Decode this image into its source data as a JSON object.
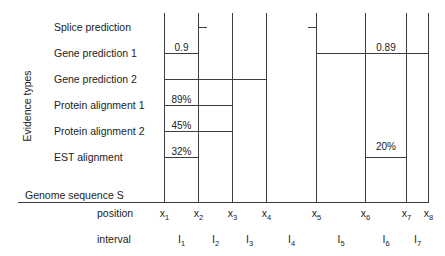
{
  "figure": {
    "y_axis_label": "Evidence types",
    "genome_label": "Genome sequence S",
    "colors": {
      "line": "#3d3d3d",
      "text": "#222222",
      "background": "#ffffff"
    }
  },
  "evidence_types": [
    {
      "label": "Splice prediction",
      "segments": [
        {
          "kind": "tick",
          "at": 2,
          "direction": "right"
        },
        {
          "kind": "tick",
          "at": 5,
          "direction": "left"
        }
      ]
    },
    {
      "label": "Gene prediction 1",
      "segments": [
        {
          "kind": "span",
          "from": 1,
          "to": 2,
          "value": "0.9"
        },
        {
          "kind": "span",
          "from": 5,
          "to": 8,
          "value": "0.89",
          "label_over": [
            6,
            7
          ]
        }
      ]
    },
    {
      "label": "Gene prediction 2",
      "segments": [
        {
          "kind": "span",
          "from": 1,
          "to": 4,
          "value": ""
        }
      ]
    },
    {
      "label": "Protein alignment 1",
      "segments": [
        {
          "kind": "span",
          "from": 1,
          "to": 3,
          "value": "89%",
          "label_over": [
            1,
            2
          ]
        }
      ]
    },
    {
      "label": "Protein alignment 2",
      "segments": [
        {
          "kind": "span",
          "from": 1,
          "to": 3,
          "value": "45%",
          "label_over": [
            1,
            2
          ]
        }
      ]
    },
    {
      "label": "EST alignment",
      "segments": [
        {
          "kind": "span",
          "from": 1,
          "to": 2,
          "value": "32%"
        },
        {
          "kind": "span",
          "from": 6,
          "to": 7,
          "value": "20%",
          "label_raise": 11
        }
      ]
    }
  ],
  "position_row": {
    "label": "position",
    "positions": [
      {
        "name": "x",
        "sub": "1"
      },
      {
        "name": "x",
        "sub": "2"
      },
      {
        "name": "x",
        "sub": "3"
      },
      {
        "name": "x",
        "sub": "4"
      },
      {
        "name": "x",
        "sub": "5"
      },
      {
        "name": "x",
        "sub": "6"
      },
      {
        "name": "x",
        "sub": "7"
      },
      {
        "name": "x",
        "sub": "8"
      }
    ]
  },
  "interval_row": {
    "label": "interval",
    "intervals": [
      {
        "name": "I",
        "sub": "1"
      },
      {
        "name": "I",
        "sub": "2"
      },
      {
        "name": "I",
        "sub": "3"
      },
      {
        "name": "I",
        "sub": "4"
      },
      {
        "name": "I",
        "sub": "5"
      },
      {
        "name": "I",
        "sub": "6"
      },
      {
        "name": "I",
        "sub": "7"
      }
    ]
  }
}
